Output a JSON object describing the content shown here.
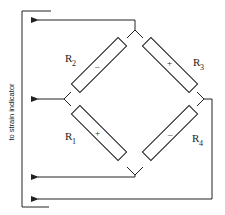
{
  "diagram": {
    "type": "wheatstone-bridge",
    "side_label": "to strain indicator",
    "resistors": [
      {
        "id": "R1",
        "label": "R",
        "subscript": "1",
        "sign": "+",
        "position": "lower-left"
      },
      {
        "id": "R2",
        "label": "R",
        "subscript": "2",
        "sign": "–",
        "position": "upper-left"
      },
      {
        "id": "R3",
        "label": "R",
        "subscript": "3",
        "sign": "+",
        "position": "upper-right"
      },
      {
        "id": "R4",
        "label": "R",
        "subscript": "4",
        "sign": "–",
        "position": "lower-right"
      }
    ],
    "leads": [
      {
        "from": "top-node",
        "to": "strain-indicator",
        "arrow": true
      },
      {
        "from": "left-node",
        "to": "strain-indicator",
        "arrow": true
      },
      {
        "from": "bottom-node",
        "to": "strain-indicator",
        "arrow": true
      },
      {
        "from": "right-node",
        "to": "strain-indicator",
        "arrow": true
      }
    ],
    "colors": {
      "line": "#222222",
      "background": "#ffffff"
    }
  }
}
